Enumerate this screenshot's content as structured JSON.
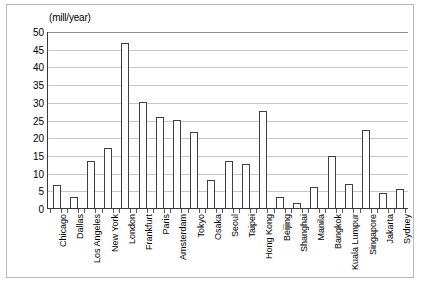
{
  "chart_data": {
    "type": "bar",
    "title": "",
    "subtitle": "",
    "unit_caption": "(mill/year)",
    "xlabel": "",
    "ylabel": "",
    "ylim": [
      0,
      50
    ],
    "ytick_step": 5,
    "yticks": [
      0,
      5,
      10,
      15,
      20,
      25,
      30,
      35,
      40,
      45,
      50
    ],
    "grid": true,
    "legend": false,
    "legend_position": "none",
    "categories": [
      "Chicago",
      "Dallas",
      "Los Angeles",
      "New York",
      "London",
      "Frankfurt",
      "Paris",
      "Amsterdam",
      "Tokyo",
      "Osaka",
      "Seoul",
      "Taipei",
      "Hong Kong",
      "Beijing",
      "Shanghai",
      "Manila",
      "Bangkok",
      "Kuala Lumpur",
      "Singapore",
      "Jakarta",
      "Sydney"
    ],
    "values": [
      6.5,
      3.0,
      13.4,
      17.0,
      46.5,
      30.0,
      25.6,
      24.8,
      21.4,
      7.8,
      13.2,
      12.3,
      27.3,
      3.0,
      1.5,
      6.0,
      14.8,
      6.8,
      22.0,
      4.2,
      5.3
    ]
  },
  "style": {
    "bar_fill": "#ffffff",
    "bar_stroke": "#3f3f3f",
    "grid_color": "#c6c6c6",
    "axis_color": "#3a3a3a",
    "frame_color": "#b9b9b9",
    "background": "#ffffff",
    "text_color": "#000000"
  }
}
